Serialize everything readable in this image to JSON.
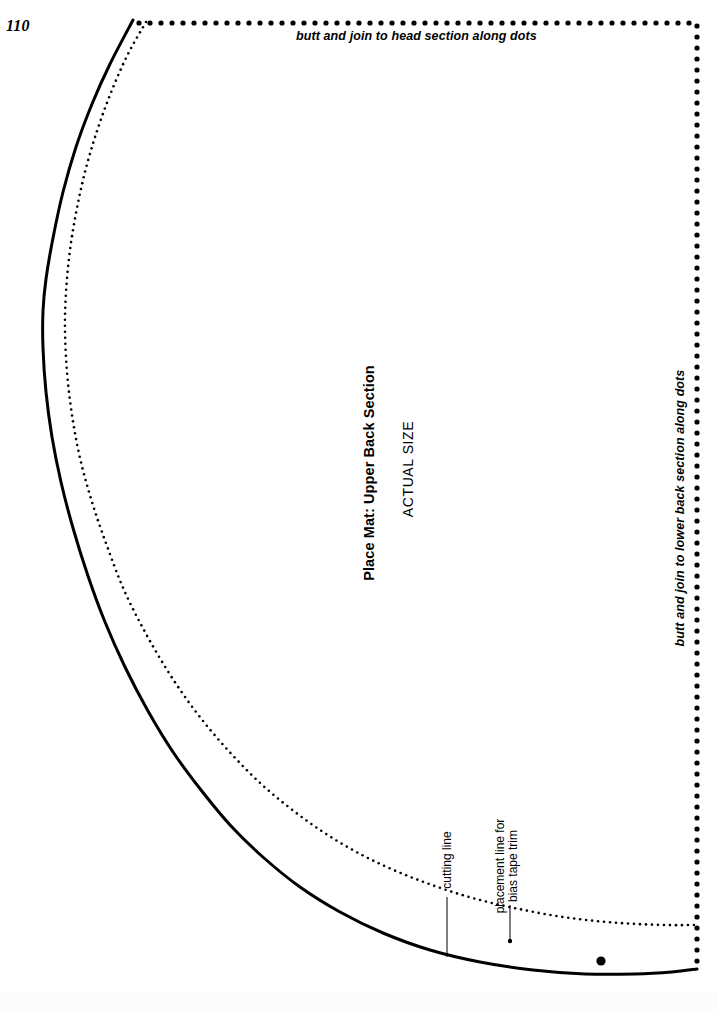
{
  "page": {
    "number": "110",
    "width": 718,
    "height": 1010,
    "background_color": "#ffffff",
    "ink_color": "#000000"
  },
  "pattern": {
    "title": "Place Mat: Upper Back Section",
    "scale_note": "ACTUAL SIZE",
    "join_top": "butt and join to head section along dots",
    "join_right": "butt and join to lower back section along dots",
    "annotations": [
      {
        "name": "cutting-line",
        "text": "cutting line",
        "target": "solid curve"
      },
      {
        "name": "bias-tape-placement-line",
        "text_line_1": "placement line for",
        "text_line_2": "bias tape trim",
        "target": "fine dotted curve"
      }
    ]
  },
  "chart_data": {
    "type": "line",
    "title": "Place Mat: Upper Back Section",
    "subtitle": "ACTUAL SIZE",
    "xlabel": "",
    "ylabel": "",
    "xlim": [
      0,
      718
    ],
    "ylim": [
      0,
      1010
    ],
    "grid": false,
    "legend": "none",
    "annotations": [
      {
        "text": "butt and join to head section along dots",
        "x": 420,
        "y": 37,
        "rotation": 0
      },
      {
        "text": "butt and join to lower back section along dots",
        "x": 681,
        "y": 508,
        "rotation": -90
      },
      {
        "text": "Place Mat: Upper Back Section",
        "x": 370,
        "y": 473,
        "rotation": -90
      },
      {
        "text": "ACTUAL SIZE",
        "x": 409,
        "y": 469,
        "rotation": -90
      },
      {
        "text": "cutting line",
        "x": 447,
        "y": 860,
        "rotation": -90
      },
      {
        "text": "placement line for bias tape trim",
        "x": 507,
        "y": 866,
        "rotation": -90
      }
    ],
    "series": [
      {
        "name": "cutting line",
        "style": "solid",
        "linewidth": 3,
        "points": [
          [
            133,
            20
          ],
          [
            110,
            64
          ],
          [
            92,
            104
          ],
          [
            76,
            147
          ],
          [
            63,
            192
          ],
          [
            53,
            238
          ],
          [
            46,
            279
          ],
          [
            43,
            311
          ],
          [
            43,
            348
          ],
          [
            46,
            392
          ],
          [
            52,
            437
          ],
          [
            61,
            482
          ],
          [
            73,
            528
          ],
          [
            88,
            576
          ],
          [
            105,
            622
          ],
          [
            125,
            667
          ],
          [
            148,
            711
          ],
          [
            173,
            752
          ],
          [
            201,
            790
          ],
          [
            231,
            826
          ],
          [
            264,
            858
          ],
          [
            300,
            887
          ],
          [
            340,
            912
          ],
          [
            383,
            933
          ],
          [
            430,
            950
          ],
          [
            480,
            962
          ],
          [
            533,
            970
          ],
          [
            585,
            974
          ],
          [
            635,
            974
          ],
          [
            672,
            972
          ],
          [
            697,
            969
          ]
        ]
      },
      {
        "name": "placement line for bias tape trim",
        "style": "fine-dotted",
        "dot_radius": 1.3,
        "dot_spacing": 6,
        "points": [
          [
            146,
            22
          ],
          [
            128,
            54
          ],
          [
            112,
            90
          ],
          [
            98,
            128
          ],
          [
            86,
            168
          ],
          [
            77,
            208
          ],
          [
            70,
            250
          ],
          [
            66,
            292
          ],
          [
            65,
            330
          ],
          [
            67,
            372
          ],
          [
            72,
            415
          ],
          [
            80,
            458
          ],
          [
            92,
            502
          ],
          [
            107,
            546
          ],
          [
            124,
            590
          ],
          [
            145,
            632
          ],
          [
            169,
            673
          ],
          [
            196,
            712
          ],
          [
            226,
            748
          ],
          [
            259,
            782
          ],
          [
            295,
            812
          ],
          [
            334,
            839
          ],
          [
            376,
            862
          ],
          [
            421,
            881
          ],
          [
            469,
            897
          ],
          [
            519,
            909
          ],
          [
            570,
            918
          ],
          [
            620,
            923
          ],
          [
            665,
            925
          ],
          [
            694,
            925
          ]
        ]
      },
      {
        "name": "join edge (large dots)",
        "style": "large-dotted",
        "dot_radius": 2.6,
        "dot_spacing": 11,
        "points": [
          [
            139,
            23
          ],
          [
            697,
            23
          ],
          [
            697,
            969
          ]
        ]
      }
    ],
    "markers": [
      {
        "name": "bias-tape-reference-dot",
        "x": 601,
        "y": 961,
        "radius": 4.6
      },
      {
        "name": "bias-tape-leader-endpoint",
        "x": 510,
        "y": 941,
        "radius": 2.2
      }
    ],
    "leader_lines": [
      {
        "name": "cutting-line-leader",
        "x1": 447,
        "y1": 897,
        "x2": 447,
        "y2": 957
      },
      {
        "name": "bias-tape-leader",
        "x1": 510,
        "y1": 905,
        "x2": 510,
        "y2": 941
      }
    ]
  }
}
